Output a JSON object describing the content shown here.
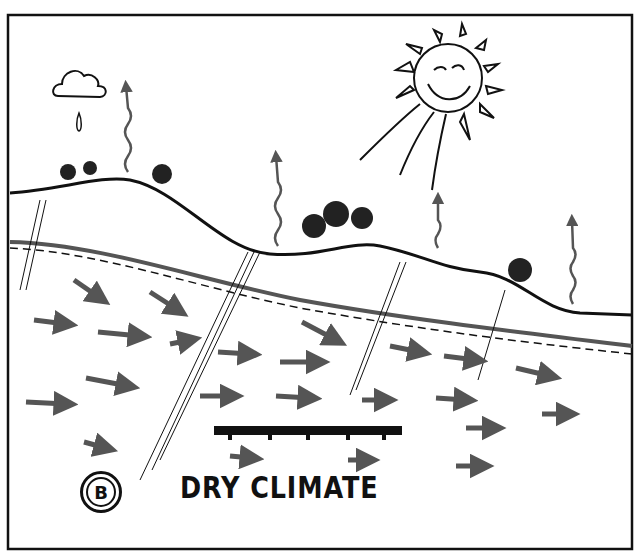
{
  "diagram": {
    "label_letter": "B",
    "caption": "DRY CLIMATE",
    "elements": [
      "sun-face",
      "cloud",
      "raindrop",
      "evaporation-arrows",
      "trees",
      "ground-surface",
      "water-table",
      "groundwater-flow-arrows",
      "well-screen",
      "root-lines"
    ],
    "colors": {
      "ink": "#111111",
      "arrow": "#555555",
      "paper": "#ffffff"
    }
  }
}
